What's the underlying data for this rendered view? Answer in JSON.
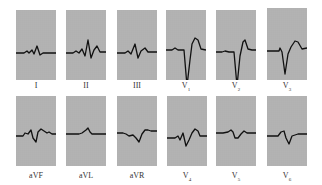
{
  "figure": {
    "colors": {
      "grid_bg": "#8c8c8c",
      "grid_line": "#d8d8d8",
      "trace": "#111111",
      "label": "#333333"
    },
    "leads": [
      {
        "id": "I",
        "label": "I",
        "sub": "",
        "row": 0,
        "x": 16,
        "y": 10,
        "w": 40,
        "h": 70
      },
      {
        "id": "II",
        "label": "II",
        "sub": "",
        "row": 0,
        "x": 66,
        "y": 10,
        "w": 40,
        "h": 70
      },
      {
        "id": "III",
        "label": "III",
        "sub": "",
        "row": 0,
        "x": 117,
        "y": 10,
        "w": 40,
        "h": 70
      },
      {
        "id": "V1",
        "label": "V",
        "sub": "1",
        "row": 0,
        "x": 166,
        "y": 10,
        "w": 40,
        "h": 70
      },
      {
        "id": "V2",
        "label": "V",
        "sub": "2",
        "row": 0,
        "x": 216,
        "y": 10,
        "w": 40,
        "h": 70
      },
      {
        "id": "V3",
        "label": "V",
        "sub": "3",
        "row": 0,
        "x": 267,
        "y": 8,
        "w": 40,
        "h": 72
      },
      {
        "id": "aVF",
        "label": "aVF",
        "sub": "",
        "row": 1,
        "x": 16,
        "y": 96,
        "w": 40,
        "h": 70
      },
      {
        "id": "aVL",
        "label": "aVL",
        "sub": "",
        "row": 1,
        "x": 66,
        "y": 96,
        "w": 40,
        "h": 70
      },
      {
        "id": "aVR",
        "label": "aVR",
        "sub": "",
        "row": 1,
        "x": 117,
        "y": 96,
        "w": 40,
        "h": 70
      },
      {
        "id": "V4",
        "label": "V",
        "sub": "4",
        "row": 1,
        "x": 167,
        "y": 96,
        "w": 40,
        "h": 70
      },
      {
        "id": "V5",
        "label": "V",
        "sub": "5",
        "row": 1,
        "x": 216,
        "y": 96,
        "w": 40,
        "h": 70
      },
      {
        "id": "V6",
        "label": "V",
        "sub": "6",
        "row": 1,
        "x": 267,
        "y": 96,
        "w": 40,
        "h": 70
      }
    ],
    "traces": {
      "I": "0,43 8,43 11,41 13,43 16,40 18,44 21,36 24,45 27,43 40,43",
      "II": "0,43 7,43 10,41 13,43 16,39 19,46 22,30 25,48 28,40 31,36 34,42 40,42",
      "III": "0,43 8,43 11,41 14,44 18,34 21,48 24,41 28,38 31,42 40,42",
      "V1": "0,40 6,40 9,38 12,40 18,40 21,76 24,50 26,34 29,28 32,30 35,39 40,40",
      "V2": "0,42 6,42 9,41 13,42 18,42 21,76 24,46 27,32 29,30 32,39 36,40 40,40",
      "V3": "0,43 8,43 12,43 13,40 15,44 18,66 21,46 24,39 28,33 31,34 35,41 40,40",
      "aVF": "0,40 7,40 9,37 12,38 15,34 17,42 20,46 22,36 25,33 28,35 31,37 33,36 36,38 40,38",
      "aVL": "0,38 13,38 16,37 20,34 22,32 24,36 26,38 40,38",
      "aVR": "0,37 6,37 9,38 12,40 16,39 19,42 22,46 25,38 28,34 31,34 34,35 40,35",
      "V4": "0,42 8,42 11,40 13,44 16,37 19,50 22,44 25,37 28,33 31,35 33,40 40,40",
      "V5": "0,37 7,37 12,36 15,34 17,36 19,42 22,42 25,38 28,35 31,37 35,37 40,37",
      "V6": "0,40 8,40 11,40 14,36 17,35 19,42 22,48 25,40 28,39 31,38 35,38 40,38"
    }
  }
}
